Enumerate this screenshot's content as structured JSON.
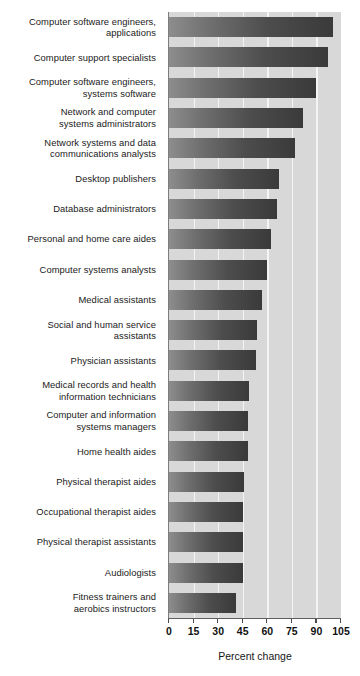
{
  "chart_data": {
    "type": "bar",
    "orientation": "horizontal",
    "title": "",
    "xlabel": "Percent change",
    "ylabel": "",
    "xlim": [
      0,
      105
    ],
    "xticks": [
      0,
      15,
      30,
      45,
      60,
      75,
      90,
      105
    ],
    "xtick_labels": [
      "0",
      "15",
      "30",
      "45",
      "60",
      "75",
      "90",
      "105"
    ],
    "grid": "vertical-white-gridlines",
    "legend": "none",
    "bar_fill": "gray-gradient-light-to-dark",
    "plot_background": "#d8d8d8",
    "categories": [
      "Computer software engineers,\napplications",
      "Computer support specialists",
      "Computer software engineers,\nsystems software",
      "Network and computer\nsystems administrators",
      "Network systems and data\ncommunications analysts",
      "Desktop publishers",
      "Database administrators",
      "Personal and home care aides",
      "Computer systems analysts",
      "Medical assistants",
      "Social and human service\nassistants",
      "Physician assistants",
      "Medical records and health\ninformation technicians",
      "Computer and information\nsystems managers",
      "Home health aides",
      "Physical therapist aides",
      "Occupational therapist aides",
      "Physical therapist assistants",
      "Audiologists",
      "Fitness trainers and\naerobics instructors"
    ],
    "values": [
      100,
      97,
      90,
      82,
      77,
      67,
      66,
      62,
      60,
      57,
      54,
      53,
      49,
      48,
      48,
      46,
      45,
      45,
      45,
      41
    ]
  },
  "colors": {
    "plot_background": "#d8d8d8",
    "gridline": "#f4f4f4",
    "bar_light": "#8d8d8d",
    "bar_dark": "#3a3a3a",
    "axis": "#5e5e5e",
    "text": "#161616"
  }
}
